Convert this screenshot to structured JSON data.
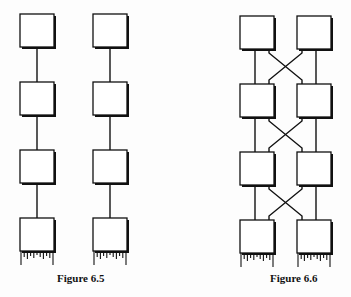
{
  "figures": [
    {
      "caption": "Figure 6.5",
      "columns": 2,
      "boxes_per_column": 4,
      "connection": "straight",
      "boxes": [
        {
          "x": 20,
          "y": 14
        },
        {
          "x": 20,
          "y": 82
        },
        {
          "x": 20,
          "y": 150
        },
        {
          "x": 20,
          "y": 218
        },
        {
          "x": 93,
          "y": 14
        },
        {
          "x": 93,
          "y": 82
        },
        {
          "x": 93,
          "y": 150
        },
        {
          "x": 93,
          "y": 218
        }
      ]
    },
    {
      "caption": "Figure 6.6",
      "columns": 2,
      "boxes_per_column": 4,
      "connection": "cross-linked",
      "boxes": [
        {
          "x": 240,
          "y": 16
        },
        {
          "x": 240,
          "y": 84
        },
        {
          "x": 240,
          "y": 152
        },
        {
          "x": 240,
          "y": 220
        },
        {
          "x": 297,
          "y": 16
        },
        {
          "x": 297,
          "y": 84
        },
        {
          "x": 297,
          "y": 152
        },
        {
          "x": 297,
          "y": 220
        }
      ]
    }
  ],
  "colors": {
    "stroke": "#111111",
    "fill": "#ffffff",
    "background": "#fdfdfd"
  }
}
